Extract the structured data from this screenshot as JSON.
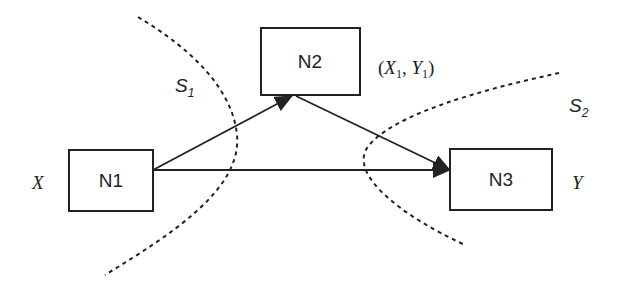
{
  "diagram": {
    "type": "network-flow",
    "nodes": [
      {
        "id": "N1",
        "label": "N1",
        "side_label": "X"
      },
      {
        "id": "N2",
        "label": "N2",
        "side_label_parts": [
          "(",
          "X",
          "1",
          ", ",
          "Y",
          "1",
          ")"
        ]
      },
      {
        "id": "N3",
        "label": "N3",
        "side_label": "Y"
      }
    ],
    "edges": [
      {
        "from": "N1",
        "to": "N2"
      },
      {
        "from": "N1",
        "to": "N3"
      },
      {
        "from": "N2",
        "to": "N3"
      }
    ],
    "boundaries": [
      {
        "id": "S1",
        "label_main": "S",
        "label_sub": "1"
      },
      {
        "id": "S2",
        "label_main": "S",
        "label_sub": "2"
      }
    ],
    "colors": {
      "line": "#222222",
      "background": "#ffffff"
    }
  }
}
